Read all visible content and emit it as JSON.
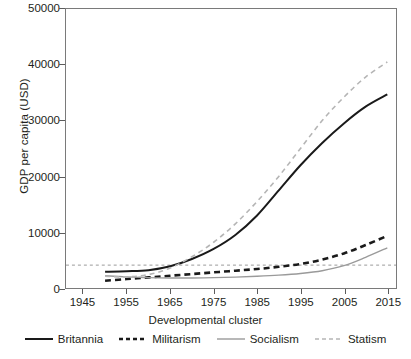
{
  "chart_data": {
    "type": "line",
    "title": "",
    "xlabel": "Developmental cluster",
    "ylabel": "GDP per capita (USD)",
    "xlim": [
      1941,
      2017
    ],
    "ylim": [
      0,
      50000
    ],
    "xticks": [
      1945,
      1955,
      1965,
      1975,
      1985,
      1995,
      2005,
      2015
    ],
    "yticks": [
      0,
      10000,
      20000,
      30000,
      40000,
      50000
    ],
    "xticklabels": [
      "1945",
      "1955",
      "1965",
      "1975",
      "1985",
      "1995",
      "2005",
      "2015"
    ],
    "yticklabels": [
      "0",
      "10000",
      "20000",
      "30000",
      "40000",
      "50000"
    ],
    "grid": false,
    "legend_position": "bottom",
    "legend_title": "Developmental cluster",
    "x": [
      1950,
      1955,
      1960,
      1965,
      1970,
      1975,
      1980,
      1985,
      1990,
      1995,
      2000,
      2005,
      2010,
      2015
    ],
    "series": [
      {
        "name": "Britannia",
        "style": "solid",
        "color": "#1a1a1a",
        "width": 2.0,
        "values": [
          2900,
          3000,
          3200,
          3900,
          5200,
          7000,
          9500,
          13000,
          17500,
          22000,
          26000,
          29500,
          32500,
          34700
        ]
      },
      {
        "name": "Militarism",
        "style": "dashed",
        "color": "#1a1a1a",
        "width": 2.6,
        "values": [
          1300,
          1600,
          1900,
          2200,
          2500,
          2800,
          3100,
          3400,
          3800,
          4300,
          5100,
          6200,
          7700,
          9350
        ]
      },
      {
        "name": "Socialism",
        "style": "solid",
        "color": "#9a9a9a",
        "width": 1.4,
        "values": [
          2200,
          2000,
          1850,
          1800,
          1800,
          1850,
          1950,
          2100,
          2300,
          2600,
          3100,
          4000,
          5500,
          7200
        ]
      },
      {
        "name": "Statism",
        "style": "dashed",
        "color": "#b5b5b5",
        "width": 1.6,
        "values": [
          2100,
          2000,
          2400,
          3600,
          5600,
          8200,
          11500,
          15500,
          20000,
          25000,
          30000,
          34200,
          37800,
          40500
        ]
      }
    ],
    "reference_line": {
      "value": 4100,
      "style": "dotted",
      "color": "#9a9a9a"
    }
  }
}
